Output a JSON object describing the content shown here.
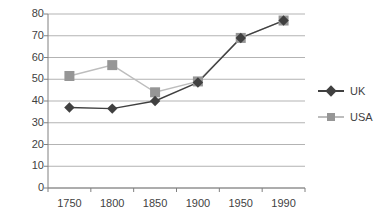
{
  "chart_data": {
    "type": "line",
    "title": "",
    "subtitle": "",
    "xlabel": "",
    "ylabel": "",
    "categories": [
      "1750",
      "1800",
      "1850",
      "1900",
      "1950",
      "1990"
    ],
    "x": [
      1750,
      1800,
      1850,
      1900,
      1950,
      1990
    ],
    "series": [
      {
        "name": "UK",
        "marker": "diamond",
        "color": "#404040",
        "values": [
          37,
          36.5,
          40,
          48.5,
          69,
          77
        ]
      },
      {
        "name": "USA",
        "marker": "square",
        "color": "#969696",
        "values": [
          51.5,
          56.5,
          44,
          49,
          69,
          77
        ]
      }
    ],
    "ylim": [
      0,
      80
    ],
    "ytick_labels": [
      "0",
      "10",
      "20",
      "30",
      "40",
      "50",
      "60",
      "70",
      "80"
    ],
    "yticks": [
      0,
      10,
      20,
      30,
      40,
      50,
      60,
      70,
      80
    ],
    "xtick_labels": [
      "1750",
      "1800",
      "1850",
      "1900",
      "1950",
      "1990"
    ],
    "grid": "horizontal",
    "legend_position": "right",
    "legend_entries": [
      "UK",
      "USA"
    ]
  },
  "legend": {
    "items": [
      {
        "label": "UK",
        "marker_icon": "diamond-marker-icon"
      },
      {
        "label": "USA",
        "marker_icon": "square-marker-icon"
      }
    ]
  },
  "colors": {
    "uk": "#404040",
    "usa": "#969696",
    "grid": "#b3b3b3",
    "axis": "#808080",
    "text": "#3f3f3f",
    "background": "#ffffff"
  }
}
